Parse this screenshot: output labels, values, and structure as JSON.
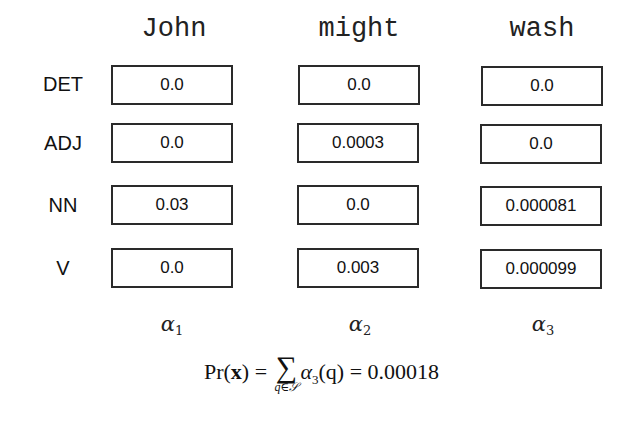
{
  "diagram": {
    "type": "forward-algorithm-trellis",
    "words": [
      "John",
      "might",
      "wash"
    ],
    "tags": [
      "DET",
      "ADJ",
      "NN",
      "V"
    ],
    "columns": [
      {
        "word": "John",
        "alpha_label": "α",
        "alpha_index": "1",
        "values": [
          "0.0",
          "0.0",
          "0.03",
          "0.0"
        ]
      },
      {
        "word": "might",
        "alpha_label": "α",
        "alpha_index": "2",
        "values": [
          "0.0",
          "0.0003",
          "0.0",
          "0.003"
        ]
      },
      {
        "word": "wash",
        "alpha_label": "α",
        "alpha_index": "3",
        "values": [
          "0.0",
          "0.0",
          "0.000081",
          "0.000099"
        ]
      }
    ],
    "formula": {
      "lhs_func": "Pr",
      "lhs_arg": "x",
      "equals": "=",
      "sum_symbol": "∑",
      "sum_subscript": "q∈𝒮",
      "term_symbol": "α",
      "term_index": "3",
      "term_arg": "(q)",
      "result": "0.00018"
    }
  }
}
